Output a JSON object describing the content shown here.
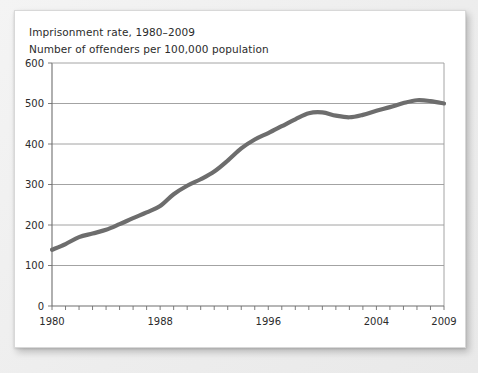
{
  "card": {
    "title": "Imprisonment rate, 1980–2009",
    "subtitle": "Number of offenders per 100,000 population"
  },
  "chart_data": {
    "type": "line",
    "title": "Imprisonment rate, 1980–2009",
    "subtitle": "Number of offenders per 100,000 population",
    "xlabel": "",
    "ylabel": "Number of offenders per 100,000 population",
    "ylim": [
      0,
      600
    ],
    "xlim": [
      1980,
      2009
    ],
    "yticks": [
      0,
      100,
      200,
      300,
      400,
      500,
      600
    ],
    "ytick_labels": [
      "0",
      "100",
      "200",
      "300",
      "400",
      "500",
      "600"
    ],
    "xticks": [
      1980,
      1988,
      1996,
      2004,
      2009
    ],
    "xtick_labels": [
      "1980",
      "1988",
      "1996",
      "2004",
      "2009"
    ],
    "minor_xtick_interval": 1,
    "grid": "horizontal",
    "legend": "none",
    "line_color": "#6d6d6d",
    "x": [
      1980,
      1981,
      1982,
      1983,
      1984,
      1985,
      1986,
      1987,
      1988,
      1989,
      1990,
      1991,
      1992,
      1993,
      1994,
      1995,
      1996,
      1997,
      1998,
      1999,
      2000,
      2001,
      2002,
      2003,
      2004,
      2005,
      2006,
      2007,
      2008,
      2009
    ],
    "values": [
      139,
      153,
      170,
      179,
      188,
      202,
      217,
      231,
      247,
      276,
      297,
      313,
      332,
      359,
      389,
      411,
      427,
      444,
      461,
      476,
      478,
      470,
      466,
      472,
      482,
      491,
      501,
      508,
      506,
      500
    ],
    "series": [
      {
        "name": "Imprisonment rate",
        "values": [
          139,
          153,
          170,
          179,
          188,
          202,
          217,
          231,
          247,
          276,
          297,
          313,
          332,
          359,
          389,
          411,
          427,
          444,
          461,
          476,
          478,
          470,
          466,
          472,
          482,
          491,
          501,
          508,
          506,
          500
        ]
      }
    ]
  }
}
